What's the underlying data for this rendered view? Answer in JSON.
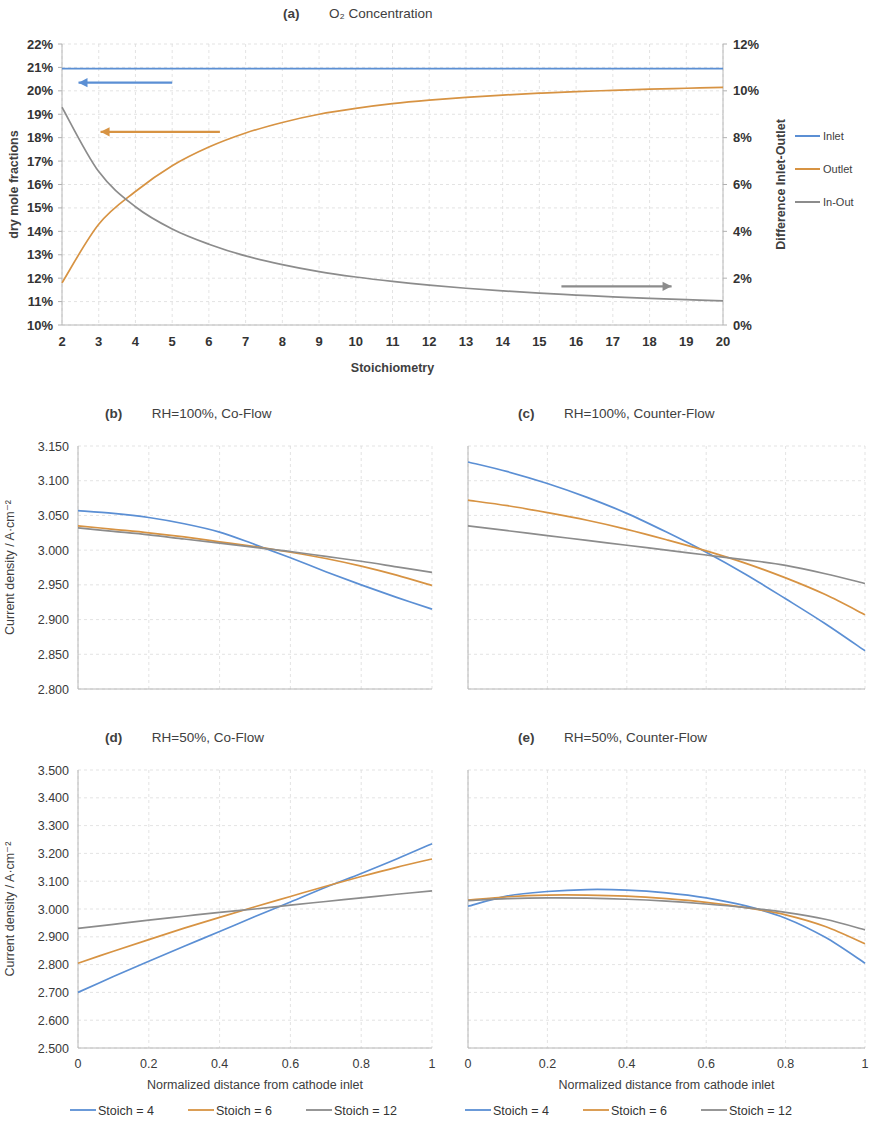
{
  "figure": {
    "background": "#ffffff",
    "colors": {
      "blue": "#5b8fd4",
      "orange": "#d79343",
      "gray": "#8c8c8c",
      "grid": "#e2e2e2",
      "axis": "#b8b8b8",
      "text": "#3d3d3d"
    }
  },
  "panel_a": {
    "tag": "(a)",
    "title": "O₂ Concentration",
    "xlabel": "Stoichiometry",
    "ylabel_left": "dry mole fractions",
    "ylabel_right": "Difference Inlet-Outlet",
    "xticks": [
      "2",
      "3",
      "4",
      "5",
      "6",
      "7",
      "8",
      "9",
      "10",
      "11",
      "12",
      "13",
      "14",
      "15",
      "16",
      "17",
      "18",
      "19",
      "20"
    ],
    "yticks_left": [
      "22%",
      "21%",
      "20%",
      "19%",
      "18%",
      "17%",
      "16%",
      "15%",
      "14%",
      "13%",
      "12%",
      "11%",
      "10%"
    ],
    "yticks_right": [
      "12%",
      "10%",
      "8%",
      "6%",
      "4%",
      "2%",
      "0%"
    ],
    "legend": [
      {
        "label": "Inlet",
        "color": "#5b8fd4"
      },
      {
        "label": "Outlet",
        "color": "#d79343"
      },
      {
        "label": "In-Out",
        "color": "#8c8c8c"
      }
    ],
    "arrow_left_blue": "←",
    "arrow_left_orange": "←",
    "arrow_right_gray": "→"
  },
  "panel_b": {
    "tag": "(b)",
    "title": "RH=100%, Co-Flow"
  },
  "panel_c": {
    "tag": "(c)",
    "title": "RH=100%, Counter-Flow"
  },
  "panel_d": {
    "tag": "(d)",
    "title": "RH=50%, Co-Flow"
  },
  "panel_e": {
    "tag": "(e)",
    "title": "RH=50%, Counter-Flow"
  },
  "axes_bottom": {
    "xlabel": "Normalized distance from cathode inlet",
    "ylabel": "Current density / A·cm⁻²",
    "xticks": [
      "0",
      "0.2",
      "0.4",
      "0.6",
      "0.8",
      "1"
    ],
    "yticks_100": [
      "3.150",
      "3.100",
      "3.050",
      "3.000",
      "2.950",
      "2.900",
      "2.850",
      "2.800"
    ],
    "yticks_50": [
      "3.500",
      "3.400",
      "3.300",
      "3.200",
      "3.100",
      "3.000",
      "2.900",
      "2.800",
      "2.700",
      "2.600",
      "2.500"
    ]
  },
  "legend_bottom": [
    {
      "label": "Stoich = 4",
      "color": "#5b8fd4"
    },
    {
      "label": "Stoich = 6",
      "color": "#d79343"
    },
    {
      "label": "Stoich = 12",
      "color": "#8c8c8c"
    }
  ],
  "chart_data": [
    {
      "id": "a",
      "type": "line",
      "title": "(a) O₂ Concentration",
      "xlabel": "Stoichiometry",
      "ylabel": "dry mole fractions",
      "ylabel_secondary": "Difference Inlet-Outlet",
      "xlim": [
        2,
        20
      ],
      "ylim": [
        0.1,
        0.22
      ],
      "ylim_secondary": [
        0.0,
        0.12
      ],
      "grid": true,
      "legend_position": "right",
      "x": [
        2,
        3,
        4,
        5,
        6,
        7,
        8,
        9,
        10,
        11,
        12,
        13,
        14,
        15,
        16,
        17,
        18,
        19,
        20
      ],
      "series": [
        {
          "name": "Inlet",
          "color": "#5b8fd4",
          "axis": "left",
          "values": [
            0.2095,
            0.2095,
            0.2095,
            0.2095,
            0.2095,
            0.2095,
            0.2095,
            0.2095,
            0.2095,
            0.2095,
            0.2095,
            0.2095,
            0.2095,
            0.2095,
            0.2095,
            0.2095,
            0.2095,
            0.2095,
            0.2095
          ]
        },
        {
          "name": "Outlet",
          "color": "#d79343",
          "axis": "left",
          "values": [
            0.118,
            0.143,
            0.157,
            0.168,
            0.176,
            0.182,
            0.1865,
            0.19,
            0.1925,
            0.1945,
            0.196,
            0.1972,
            0.1982,
            0.199,
            0.1997,
            0.2002,
            0.2007,
            0.2011,
            0.2015
          ]
        },
        {
          "name": "In-Out",
          "color": "#8c8c8c",
          "axis": "right",
          "values": [
            0.093,
            0.0655,
            0.0505,
            0.041,
            0.0345,
            0.0295,
            0.0258,
            0.0228,
            0.0205,
            0.0186,
            0.017,
            0.0157,
            0.0146,
            0.0136,
            0.0128,
            0.012,
            0.0114,
            0.0108,
            0.0103
          ]
        }
      ]
    },
    {
      "id": "b",
      "type": "line",
      "title": "(b) RH=100%, Co-Flow",
      "xlabel": "Normalized distance from cathode inlet",
      "ylabel": "Current density / A·cm⁻²",
      "xlim": [
        0,
        1
      ],
      "ylim": [
        2.8,
        3.15
      ],
      "grid": true,
      "legend_position": "bottom",
      "x": [
        0,
        0.1,
        0.2,
        0.3,
        0.4,
        0.5,
        0.6,
        0.7,
        0.8,
        0.9,
        1.0
      ],
      "series": [
        {
          "name": "Stoich = 4",
          "color": "#5b8fd4",
          "values": [
            3.057,
            3.053,
            3.047,
            3.038,
            3.026,
            3.008,
            2.989,
            2.969,
            2.95,
            2.932,
            2.915
          ]
        },
        {
          "name": "Stoich = 6",
          "color": "#d79343",
          "values": [
            3.035,
            3.03,
            3.025,
            3.019,
            3.012,
            3.005,
            2.997,
            2.988,
            2.977,
            2.964,
            2.949
          ]
        },
        {
          "name": "Stoich = 12",
          "color": "#8c8c8c",
          "values": [
            3.032,
            3.027,
            3.022,
            3.016,
            3.01,
            3.004,
            2.998,
            2.991,
            2.984,
            2.976,
            2.968
          ]
        }
      ]
    },
    {
      "id": "c",
      "type": "line",
      "title": "(c) RH=100%, Counter-Flow",
      "xlabel": "Normalized distance from cathode inlet",
      "ylabel": "Current density / A·cm⁻²",
      "xlim": [
        0,
        1
      ],
      "ylim": [
        2.8,
        3.15
      ],
      "grid": true,
      "legend_position": "bottom",
      "x": [
        0,
        0.1,
        0.2,
        0.3,
        0.4,
        0.5,
        0.6,
        0.7,
        0.8,
        0.9,
        1.0
      ],
      "series": [
        {
          "name": "Stoich = 4",
          "color": "#5b8fd4",
          "values": [
            3.127,
            3.113,
            3.096,
            3.076,
            3.053,
            3.026,
            2.997,
            2.965,
            2.93,
            2.894,
            2.855
          ]
        },
        {
          "name": "Stoich = 6",
          "color": "#d79343",
          "values": [
            3.072,
            3.064,
            3.054,
            3.043,
            3.03,
            3.015,
            2.999,
            2.981,
            2.96,
            2.936,
            2.907
          ]
        },
        {
          "name": "Stoich = 12",
          "color": "#8c8c8c",
          "values": [
            3.035,
            3.028,
            3.021,
            3.014,
            3.007,
            3.0,
            2.993,
            2.986,
            2.978,
            2.966,
            2.952
          ]
        }
      ]
    },
    {
      "id": "d",
      "type": "line",
      "title": "(d) RH=50%, Co-Flow",
      "xlabel": "Normalized distance from cathode inlet",
      "ylabel": "Current density / A·cm⁻²",
      "xlim": [
        0,
        1
      ],
      "ylim": [
        2.5,
        3.5
      ],
      "grid": true,
      "legend_position": "bottom",
      "x": [
        0,
        0.1,
        0.2,
        0.3,
        0.4,
        0.5,
        0.6,
        0.7,
        0.8,
        0.9,
        1.0
      ],
      "series": [
        {
          "name": "Stoich = 4",
          "color": "#5b8fd4",
          "values": [
            2.7,
            2.757,
            2.812,
            2.866,
            2.919,
            2.973,
            3.025,
            3.078,
            3.128,
            3.18,
            3.235
          ]
        },
        {
          "name": "Stoich = 6",
          "color": "#d79343",
          "values": [
            2.805,
            2.848,
            2.89,
            2.931,
            2.97,
            3.008,
            3.045,
            3.082,
            3.117,
            3.15,
            3.18
          ]
        },
        {
          "name": "Stoich = 12",
          "color": "#8c8c8c",
          "values": [
            2.93,
            2.945,
            2.96,
            2.974,
            2.988,
            3.0,
            3.014,
            3.027,
            3.04,
            3.053,
            3.065
          ]
        }
      ]
    },
    {
      "id": "e",
      "type": "line",
      "title": "(e) RH=50%, Counter-Flow",
      "xlabel": "Normalized distance from cathode inlet",
      "ylabel": "Current density / A·cm⁻²",
      "xlim": [
        0,
        1
      ],
      "ylim": [
        2.5,
        3.5
      ],
      "grid": true,
      "legend_position": "bottom",
      "x": [
        0,
        0.1,
        0.2,
        0.3,
        0.4,
        0.5,
        0.6,
        0.7,
        0.8,
        0.9,
        1.0
      ],
      "series": [
        {
          "name": "Stoich = 4",
          "color": "#5b8fd4",
          "values": [
            3.01,
            3.047,
            3.063,
            3.07,
            3.068,
            3.058,
            3.04,
            3.011,
            2.967,
            2.898,
            2.805
          ]
        },
        {
          "name": "Stoich = 6",
          "color": "#d79343",
          "values": [
            3.032,
            3.044,
            3.05,
            3.05,
            3.046,
            3.037,
            3.024,
            3.005,
            2.979,
            2.937,
            2.875
          ]
        },
        {
          "name": "Stoich = 12",
          "color": "#8c8c8c",
          "values": [
            3.03,
            3.037,
            3.04,
            3.039,
            3.035,
            3.028,
            3.018,
            3.005,
            2.988,
            2.963,
            2.925
          ]
        }
      ]
    }
  ]
}
